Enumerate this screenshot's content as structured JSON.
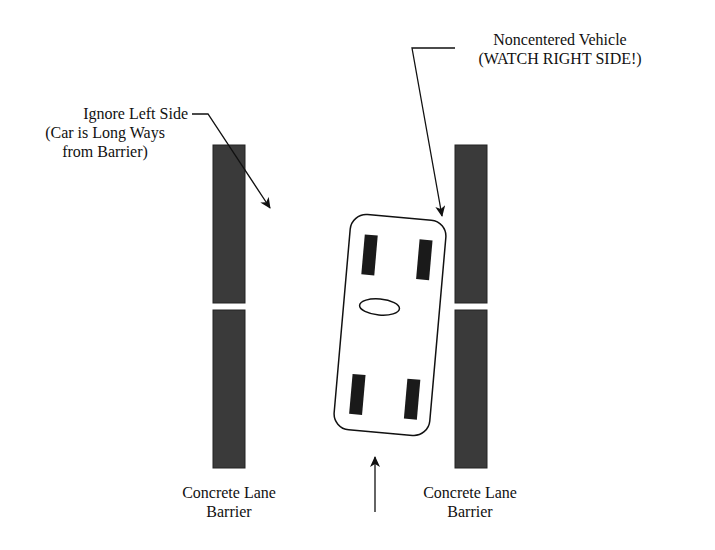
{
  "diagram": {
    "labels": {
      "left_note_line1": "Ignore Left Side",
      "left_note_line2": "(Car is Long Ways",
      "left_note_line3": "from Barrier)",
      "right_note_line1": "Noncentered Vehicle",
      "right_note_line2": "(WATCH RIGHT SIDE!)",
      "left_barrier_line1": "Concrete Lane",
      "left_barrier_line2": "Barrier",
      "right_barrier_line1": "Concrete Lane",
      "right_barrier_line2": "Barrier"
    },
    "colors": {
      "barrier_fill": "#3a3a3a",
      "line": "#111111",
      "tire": "#1a1a1a",
      "background": "#ffffff"
    },
    "elements": {
      "left_barrier": {
        "x": 213,
        "width": 32,
        "segments": [
          [
            145,
            303
          ],
          [
            310,
            468
          ]
        ]
      },
      "right_barrier": {
        "x": 455,
        "width": 32,
        "segments": [
          [
            145,
            303
          ],
          [
            310,
            468
          ]
        ]
      },
      "vehicle": {
        "center": [
          390,
          325
        ],
        "rotation_deg": 5,
        "width": 95,
        "height": 215
      },
      "direction_arrow": {
        "from": [
          375,
          512
        ],
        "to": [
          375,
          455
        ]
      }
    }
  }
}
